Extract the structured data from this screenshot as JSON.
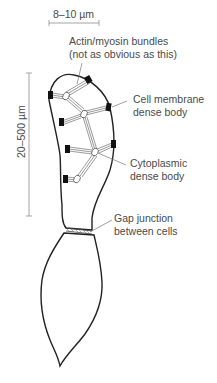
{
  "figure": {
    "type": "smooth muscle cell diagram",
    "scale_bars": {
      "width": {
        "label": "8–10 µm",
        "orientation": "horizontal"
      },
      "length": {
        "label": "20–500 µm",
        "orientation": "vertical"
      }
    },
    "labels": [
      {
        "id": "actin",
        "line1": "Actin/myosin bundles",
        "line2": "(not as obvious as this)"
      },
      {
        "id": "membrane",
        "line1": "Cell membrane",
        "line2": "dense body"
      },
      {
        "id": "cytoplasmic",
        "line1": "Cytoplasmic",
        "line2": "dense body"
      },
      {
        "id": "gap",
        "line1": "Gap junction",
        "line2": "between cells"
      }
    ],
    "colors": {
      "outline": "#222222",
      "text": "#4a4a4a",
      "scale_bar": "#9a9a9a",
      "dense_body": "#111111",
      "background": "#ffffff"
    }
  }
}
